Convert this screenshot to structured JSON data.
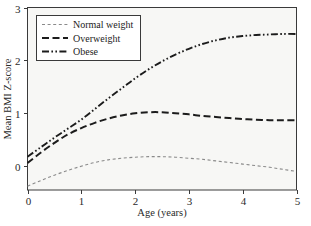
{
  "chart_data": {
    "type": "line",
    "title": "",
    "xlabel": "Age (years)",
    "ylabel": "Mean BMI Z-score",
    "xlim": [
      0,
      5
    ],
    "ylim": [
      -0.45,
      3
    ],
    "xticks": [
      "0",
      "1",
      "2",
      "3",
      "4",
      "5"
    ],
    "xtick_values": [
      0,
      1,
      2,
      3,
      4,
      5
    ],
    "yticks": [
      "0",
      "1",
      "2",
      "3"
    ],
    "ytick_values": [
      0,
      1,
      2,
      3
    ],
    "grid": false,
    "legend_position": "top-left",
    "x": [
      0,
      0.25,
      0.5,
      0.75,
      1,
      1.25,
      1.5,
      1.75,
      2,
      2.25,
      2.5,
      2.75,
      3,
      3.25,
      3.5,
      3.75,
      4,
      4.25,
      4.5,
      4.75,
      5
    ],
    "series": [
      {
        "name": "Normal weight",
        "style": "dotted",
        "color": "#8a8a8a",
        "values": [
          -0.38,
          -0.27,
          -0.17,
          -0.08,
          0.0,
          0.07,
          0.12,
          0.15,
          0.17,
          0.18,
          0.18,
          0.17,
          0.15,
          0.13,
          0.1,
          0.07,
          0.04,
          0.01,
          -0.02,
          -0.06,
          -0.1
        ]
      },
      {
        "name": "Overweight",
        "style": "dashed",
        "color": "#1c1c1c",
        "values": [
          0.06,
          0.26,
          0.44,
          0.6,
          0.72,
          0.82,
          0.9,
          0.96,
          1.0,
          1.02,
          1.02,
          1.0,
          0.98,
          0.95,
          0.93,
          0.91,
          0.89,
          0.88,
          0.87,
          0.87,
          0.87
        ]
      },
      {
        "name": "Obese",
        "style": "dash-dot-dot",
        "color": "#1c1c1c",
        "values": [
          0.18,
          0.36,
          0.54,
          0.71,
          0.88,
          1.08,
          1.28,
          1.47,
          1.66,
          1.83,
          1.98,
          2.11,
          2.22,
          2.31,
          2.38,
          2.43,
          2.46,
          2.48,
          2.49,
          2.5,
          2.5
        ]
      }
    ]
  },
  "legend": {
    "items": [
      {
        "label": "Normal weight"
      },
      {
        "label": "Overweight"
      },
      {
        "label": "Obese"
      }
    ]
  },
  "axes": {
    "x_title": "Age (years)",
    "y_title": "Mean BMI Z-score"
  },
  "colors": {
    "plot_background": "#f7f7f5",
    "frame": "#3a3a3a",
    "normal_weight": "#8a8a8a",
    "overweight": "#1c1c1c",
    "obese": "#1c1c1c",
    "text": "#2a2a2a"
  }
}
